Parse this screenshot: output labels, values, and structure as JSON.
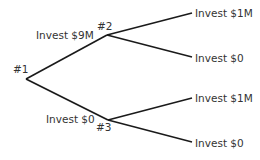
{
  "diagram": {
    "type": "decision-tree",
    "nodes": {
      "n1": {
        "label": "#1"
      },
      "n2": {
        "label": "#2"
      },
      "n3": {
        "label": "#3"
      }
    },
    "edges": {
      "e12": {
        "label": "Invest $9M"
      },
      "e13": {
        "label": "Invest $0"
      },
      "e2a": {
        "label": "Invest $1M"
      },
      "e2b": {
        "label": "Invest $0"
      },
      "e3a": {
        "label": "Invest $1M"
      },
      "e3b": {
        "label": "Invest $0"
      }
    },
    "line_color": "#1a1a1a",
    "text_color": "#333333"
  }
}
